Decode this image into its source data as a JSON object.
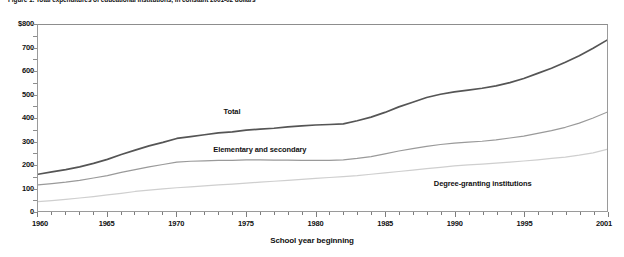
{
  "figure": {
    "caption": "Figure 1. Total expenditures of educational institutions, in constant 2001-02 dollars",
    "xaxis_title": "School year beginning"
  },
  "chart_data": {
    "type": "line",
    "title": "Total expenditures of educational institutions, in constant 2001-02 dollars",
    "xlabel": "School year beginning",
    "ylabel": "",
    "xlim": [
      1960,
      2001
    ],
    "ylim": [
      0,
      800
    ],
    "grid": false,
    "legend_position": "inline-labels",
    "y_tick_labels": [
      "$800",
      "700",
      "600",
      "500",
      "400",
      "300",
      "200",
      "100",
      "0"
    ],
    "y_tick_values": [
      800,
      700,
      600,
      500,
      400,
      300,
      200,
      100,
      0
    ],
    "x_tick_labels": [
      "1960",
      "1965",
      "1970",
      "1975",
      "1980",
      "1985",
      "1990",
      "1995",
      "2001"
    ],
    "x_tick_values": [
      1960,
      1965,
      1970,
      1975,
      1980,
      1985,
      1990,
      1995,
      2001
    ],
    "x": [
      1960,
      1961,
      1962,
      1963,
      1964,
      1965,
      1966,
      1967,
      1968,
      1969,
      1970,
      1971,
      1972,
      1973,
      1974,
      1975,
      1976,
      1977,
      1978,
      1979,
      1980,
      1981,
      1982,
      1983,
      1984,
      1985,
      1986,
      1987,
      1988,
      1989,
      1990,
      1991,
      1992,
      1993,
      1994,
      1995,
      1996,
      1997,
      1998,
      1999,
      2000,
      2001
    ],
    "series": [
      {
        "name": "Total",
        "color": "#555555",
        "width": 1.7,
        "label_x": 1974,
        "label_y": 430,
        "values": [
          158,
          168,
          178,
          190,
          205,
          222,
          243,
          262,
          280,
          295,
          312,
          320,
          328,
          336,
          340,
          348,
          352,
          356,
          362,
          366,
          370,
          372,
          375,
          388,
          404,
          424,
          448,
          468,
          488,
          502,
          512,
          520,
          528,
          538,
          552,
          570,
          592,
          614,
          640,
          668,
          700,
          735
        ]
      },
      {
        "name": "Elementary and secondary",
        "color": "#9a9a9a",
        "width": 1.2,
        "label_x": 1976,
        "label_y": 270,
        "values": [
          112,
          118,
          124,
          132,
          142,
          152,
          166,
          178,
          190,
          200,
          210,
          214,
          216,
          218,
          218,
          220,
          220,
          219,
          219,
          218,
          218,
          218,
          220,
          226,
          234,
          246,
          258,
          268,
          278,
          286,
          292,
          296,
          300,
          306,
          314,
          322,
          334,
          346,
          360,
          378,
          400,
          425
        ]
      },
      {
        "name": "Degree-granting institutions",
        "color": "#cfcfcf",
        "width": 1.2,
        "label_x": 1992,
        "label_y": 122,
        "values": [
          40,
          45,
          50,
          56,
          62,
          69,
          76,
          84,
          90,
          95,
          100,
          104,
          108,
          112,
          116,
          120,
          124,
          128,
          132,
          136,
          140,
          144,
          148,
          152,
          158,
          164,
          170,
          176,
          182,
          188,
          194,
          198,
          202,
          206,
          210,
          215,
          220,
          226,
          232,
          240,
          250,
          265
        ]
      }
    ]
  }
}
